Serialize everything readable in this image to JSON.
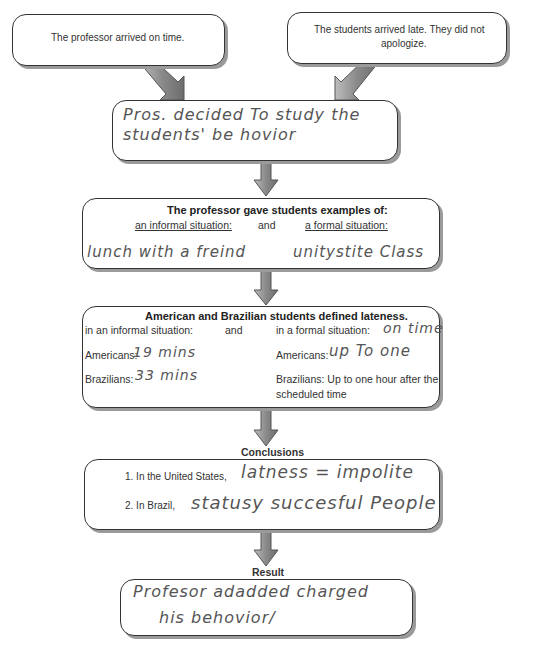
{
  "top_left_box": {
    "text": "The professor arrived on time."
  },
  "top_right_box": {
    "line1": "The students arrived late. They did not",
    "line2": "apologize."
  },
  "decision_box": {
    "line1": "Pros. decided To study the",
    "line2": "students' be hovior"
  },
  "examples_box": {
    "title": "The professor gave students examples of:",
    "informal_label": "an informal situation:",
    "and_label": "and",
    "formal_label": "a formal situation:",
    "informal_answer": "lunch with a freind",
    "formal_answer": "unitystite Class"
  },
  "lateness_box": {
    "title": "American and Brazilian students defined lateness.",
    "informal_label": "in an informal situation:",
    "and_label": "and",
    "formal_label": "in a formal situation:",
    "formal_answer": "on time",
    "americans_label_left": "Americans:",
    "americans_informal": "19 mins",
    "brazilians_label_left": "Brazilians:",
    "brazilians_informal": "33 mins",
    "americans_label_right": "Americans:",
    "americans_formal": "up To one",
    "brazilians_formal_line1": "Brazilians: Up to one hour after the",
    "brazilians_formal_line2": "scheduled time"
  },
  "conclusions": {
    "heading": "Conclusions",
    "item1_label": "1. In the United States,",
    "item1_answer": "latness = impolite",
    "item2_label": "2. In Brazil,",
    "item2_answer": "statusy succesful People"
  },
  "result": {
    "heading": "Result",
    "line1": "Profesor adadded charged",
    "line2": "his behovior/"
  },
  "colors": {
    "arrow_fill": "#8c8c8c",
    "arrow_stroke": "#555555",
    "border": "#333333",
    "shadow": "#9a9a9a"
  }
}
